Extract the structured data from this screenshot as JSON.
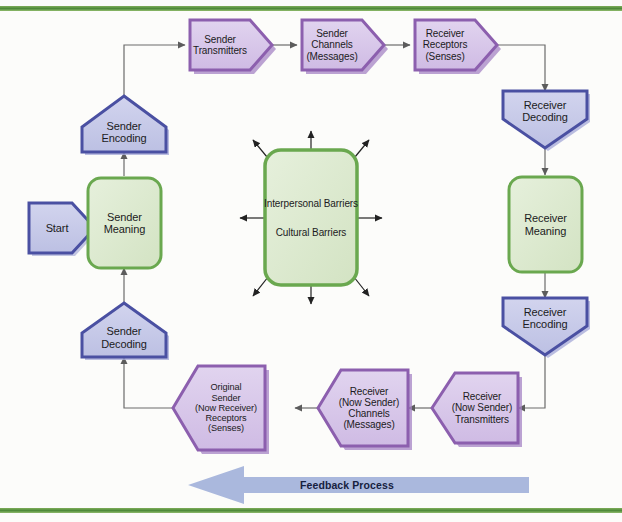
{
  "diagram": {
    "background_color": "#fcfcfa",
    "frame_rule_color": "#4f8a3a"
  },
  "colors": {
    "green_fill": "#dcead0",
    "green_border": "#6aa84f",
    "purple_fill": "#d9c9ea",
    "purple_border": "#8c5fae",
    "blue_fill": "#c8cbe9",
    "blue_border": "#4a50a2",
    "connector": "#6b6b6b",
    "feedback_arrow": "#aab8dd",
    "text": "#1b1b22"
  },
  "nodes": {
    "start": {
      "label": "Start",
      "shape": "pentagon-right",
      "style": "blue"
    },
    "sender_meaning": {
      "lines": [
        "Sender",
        "Meaning"
      ],
      "shape": "rounded-rect",
      "style": "green"
    },
    "sender_encoding": {
      "lines": [
        "Sender",
        "Encoding"
      ],
      "shape": "pentagon-up",
      "style": "blue"
    },
    "sender_decoding": {
      "lines": [
        "Sender",
        "Decoding"
      ],
      "shape": "pentagon-up",
      "style": "blue"
    },
    "sender_transmitters": {
      "lines": [
        "Sender",
        "Transmitters"
      ],
      "shape": "pentagon-right",
      "style": "purple"
    },
    "sender_channels": {
      "lines": [
        "Sender",
        "Channels",
        "(Messages)"
      ],
      "shape": "pentagon-right",
      "style": "purple"
    },
    "receiver_receptors": {
      "lines": [
        "Receiver",
        "Receptors",
        "(Senses)"
      ],
      "shape": "pentagon-right",
      "style": "purple"
    },
    "receiver_decoding": {
      "lines": [
        "Receiver",
        "Decoding"
      ],
      "shape": "pentagon-down",
      "style": "blue"
    },
    "receiver_meaning": {
      "lines": [
        "Receiver",
        "Meaning"
      ],
      "shape": "rounded-rect",
      "style": "green"
    },
    "receiver_encoding": {
      "lines": [
        "Receiver",
        "Encoding"
      ],
      "shape": "pentagon-down",
      "style": "blue"
    },
    "receiver_now_sender_transmitters": {
      "lines": [
        "Receiver",
        "(Now Sender)",
        "Transmitters"
      ],
      "shape": "pentagon-left",
      "style": "purple"
    },
    "receiver_now_sender_channels": {
      "lines": [
        "Receiver",
        "(Now Sender)",
        "Channels",
        "(Messages)"
      ],
      "shape": "pentagon-left",
      "style": "purple"
    },
    "original_sender_receptors": {
      "lines": [
        "Original",
        "Sender",
        "(Now Receiver)",
        "Receptors",
        "(Senses)"
      ],
      "shape": "pentagon-left",
      "style": "purple"
    },
    "barriers": {
      "lines": [
        "Interpersonal Barriers",
        "Cultural Barriers"
      ],
      "shape": "rounded-rect",
      "style": "green"
    }
  },
  "feedback": {
    "label": "Feedback Process",
    "direction": "left"
  }
}
